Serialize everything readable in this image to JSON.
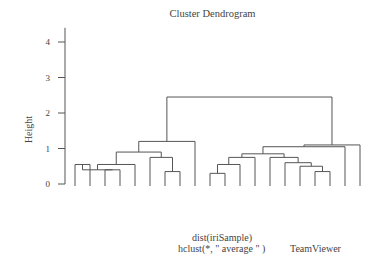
{
  "chart_data": {
    "type": "dendrogram",
    "title": "Cluster Dendrogram",
    "ylabel": "Height",
    "xlabel": "dist(iriSample)",
    "sub": "hclust(*, \" average \" )",
    "yticks": [
      0,
      1,
      2,
      3,
      4
    ],
    "ylim": [
      0,
      4.4
    ],
    "leaves": [
      "setosa",
      "setosa",
      "setosa",
      "setosa",
      "setosa",
      "setosa",
      "setosa",
      "setosa",
      "virginica",
      "virginica",
      "virginica",
      "virginica",
      "virginica",
      "virginica",
      "virginica",
      "virginica",
      "virginica",
      "virginica",
      "virginica",
      "virginica"
    ],
    "merges": [
      {
        "left_x": 75,
        "right_x": 90,
        "height": 0.55
      },
      {
        "left_x": 105,
        "right_x": 120,
        "height": 0.4
      },
      {
        "left_x": 97,
        "right_x": 112,
        "height": 0.4
      },
      {
        "left_x": 82,
        "right_x": 105,
        "height": 0.55
      },
      {
        "left_x": 165,
        "right_x": 180,
        "height": 0.35
      },
      {
        "left_x": 150,
        "right_x": 172,
        "height": 0.75
      },
      {
        "left_x": 135,
        "right_x": 161,
        "height": 0.9
      },
      {
        "left_x": 88,
        "right_x": 148,
        "height": 1.2
      },
      {
        "left_x": 195,
        "right_x": 210,
        "height": 0.3
      },
      {
        "left_x": 225,
        "right_x": 240,
        "height": 0.55
      },
      {
        "left_x": 202,
        "right_x": 232,
        "height": 0.75
      },
      {
        "left_x": 315,
        "right_x": 330,
        "height": 0.35
      },
      {
        "left_x": 300,
        "right_x": 322,
        "height": 0.5
      },
      {
        "left_x": 285,
        "right_x": 311,
        "height": 0.6
      },
      {
        "left_x": 270,
        "right_x": 298,
        "height": 0.75
      },
      {
        "left_x": 255,
        "right_x": 284,
        "height": 0.85
      },
      {
        "left_x": 217,
        "right_x": 270,
        "height": 1.05
      },
      {
        "left_x": 345,
        "right_x": 360,
        "height": 1.1
      },
      {
        "left_x": 244,
        "right_x": 352,
        "height": 2.45
      },
      {
        "left_x": 118,
        "right_x": 297,
        "height": 4.2
      }
    ],
    "cluster_boxes": [
      {
        "label": "cluster-1",
        "leaves": "setosa x8",
        "x0": 71,
        "x1": 186
      },
      {
        "label": "cluster-2",
        "leaves": "virginica x10",
        "x0": 189,
        "x1": 335
      },
      {
        "label": "cluster-3",
        "leaves": "virginica x2",
        "x0": 339,
        "x1": 366
      }
    ],
    "k": 3,
    "grid": false,
    "legend": null
  },
  "watermark": "TeamViewer"
}
